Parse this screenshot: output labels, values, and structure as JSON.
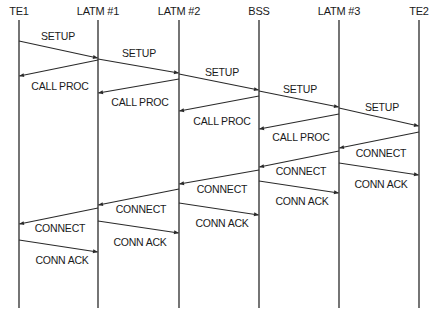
{
  "diagram": {
    "type": "sequence-diagram",
    "colors": {
      "line": "#2a2a2a",
      "text": "#1a1a1a",
      "background": "#ffffff"
    },
    "lifeline_top": 20,
    "lifeline_bottom": 308,
    "entities": [
      {
        "id": "TE1",
        "label": "TE1",
        "x": 19
      },
      {
        "id": "LATM1",
        "label": "LATM #1",
        "x": 98
      },
      {
        "id": "LATM2",
        "label": "LATM #2",
        "x": 179
      },
      {
        "id": "BSS",
        "label": "BSS",
        "x": 259
      },
      {
        "id": "LATM3",
        "label": "LATM #3",
        "x": 339
      },
      {
        "id": "TE2",
        "label": "TE2",
        "x": 419
      }
    ],
    "messages": [
      {
        "label": "SETUP",
        "from": "TE1",
        "to": "LATM1",
        "y1": 41,
        "y2": 58,
        "lx": 58,
        "ly": 30
      },
      {
        "label": "SETUP",
        "from": "LATM1",
        "to": "LATM2",
        "y1": 59,
        "y2": 73,
        "lx": 139,
        "ly": 47
      },
      {
        "label": "SETUP",
        "from": "LATM2",
        "to": "BSS",
        "y1": 74,
        "y2": 90,
        "lx": 222,
        "ly": 66
      },
      {
        "label": "SETUP",
        "from": "BSS",
        "to": "LATM3",
        "y1": 91,
        "y2": 107,
        "lx": 300,
        "ly": 83
      },
      {
        "label": "SETUP",
        "from": "LATM3",
        "to": "TE2",
        "y1": 108,
        "y2": 126,
        "lx": 382,
        "ly": 101
      },
      {
        "label": "CALL PROC",
        "from": "LATM1",
        "to": "TE1",
        "y1": 60,
        "y2": 76,
        "lx": 60,
        "ly": 80
      },
      {
        "label": "CALL PROC",
        "from": "LATM2",
        "to": "LATM1",
        "y1": 79,
        "y2": 93,
        "lx": 140,
        "ly": 96
      },
      {
        "label": "CALL PROC",
        "from": "BSS",
        "to": "LATM2",
        "y1": 96,
        "y2": 111,
        "lx": 222,
        "ly": 115
      },
      {
        "label": "CALL PROC",
        "from": "LATM3",
        "to": "BSS",
        "y1": 114,
        "y2": 129,
        "lx": 301,
        "ly": 131
      },
      {
        "label": "CONNECT",
        "from": "TE2",
        "to": "LATM3",
        "y1": 132,
        "y2": 148,
        "lx": 381,
        "ly": 147
      },
      {
        "label": "CONNECT",
        "from": "LATM3",
        "to": "BSS",
        "y1": 151,
        "y2": 167,
        "lx": 301,
        "ly": 165
      },
      {
        "label": "CONNECT",
        "from": "BSS",
        "to": "LATM2",
        "y1": 170,
        "y2": 184,
        "lx": 222,
        "ly": 183
      },
      {
        "label": "CONNECT",
        "from": "LATM2",
        "to": "LATM1",
        "y1": 189,
        "y2": 205,
        "lx": 141,
        "ly": 203
      },
      {
        "label": "CONNECT",
        "from": "LATM1",
        "to": "TE1",
        "y1": 208,
        "y2": 224,
        "lx": 60,
        "ly": 222
      },
      {
        "label": "CONN ACK",
        "from": "LATM3",
        "to": "TE2",
        "y1": 163,
        "y2": 175,
        "lx": 381,
        "ly": 178
      },
      {
        "label": "CONN ACK",
        "from": "BSS",
        "to": "LATM3",
        "y1": 181,
        "y2": 193,
        "lx": 302,
        "ly": 195
      },
      {
        "label": "CONN ACK",
        "from": "LATM2",
        "to": "BSS",
        "y1": 203,
        "y2": 215,
        "lx": 222,
        "ly": 217
      },
      {
        "label": "CONN ACK",
        "from": "LATM1",
        "to": "LATM2",
        "y1": 221,
        "y2": 233,
        "lx": 140,
        "ly": 236
      },
      {
        "label": "CONN ACK",
        "from": "TE1",
        "to": "LATM1",
        "y1": 240,
        "y2": 252,
        "lx": 62,
        "ly": 254
      }
    ]
  }
}
